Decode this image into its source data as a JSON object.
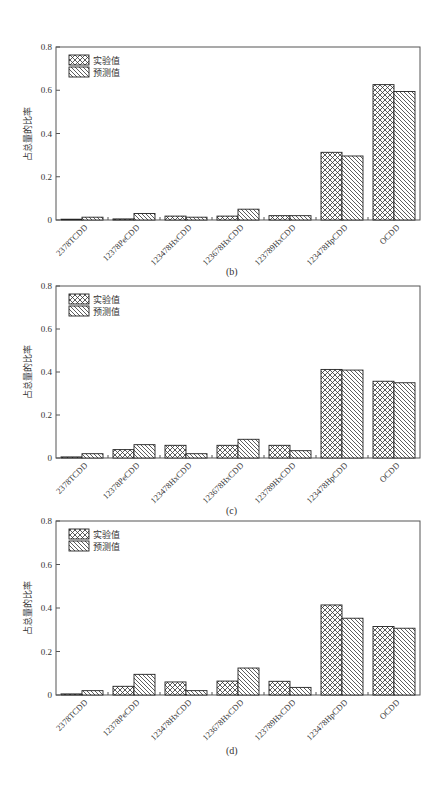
{
  "figure": {
    "panels": [
      {
        "id": "b",
        "caption": "(b)"
      },
      {
        "id": "c",
        "caption": "(c)"
      },
      {
        "id": "d",
        "caption": "(d)"
      }
    ]
  },
  "colors": {
    "axis": "#555555",
    "bar_stroke": "#222222",
    "pattern_line": "#333333",
    "background": "#ffffff"
  },
  "legend": {
    "experimental": "实验值",
    "predicted": "预测值"
  },
  "chart_data": [
    {
      "type": "bar",
      "title": "(b)",
      "xlabel": "",
      "ylabel": "占总量的比率",
      "ylim": [
        0,
        0.8
      ],
      "yticks": [
        "0",
        "0.2",
        "0.4",
        "0.6",
        "0.8"
      ],
      "grid": false,
      "legend_position": "upper left",
      "categories": [
        "2378TCDD",
        "12378PeCDD",
        "123478HxCDD",
        "123678HxCDD",
        "123789HxCDD",
        "123478HpCDD",
        "OCDD"
      ],
      "series": [
        {
          "name": "实验值",
          "pattern": "crosshatch",
          "values": [
            0.0,
            0.005,
            0.018,
            0.018,
            0.02,
            0.313,
            0.626
          ]
        },
        {
          "name": "预测值",
          "pattern": "diagonal",
          "values": [
            0.013,
            0.03,
            0.013,
            0.05,
            0.02,
            0.296,
            0.594
          ]
        }
      ]
    },
    {
      "type": "bar",
      "title": "(c)",
      "xlabel": "",
      "ylabel": "占总量的比率",
      "ylim": [
        0,
        0.8
      ],
      "yticks": [
        "0",
        "0.2",
        "0.4",
        "0.6",
        "0.8"
      ],
      "grid": false,
      "legend_position": "upper left",
      "categories": [
        "2378TCDD",
        "12378PeCDD",
        "123478HxCDD",
        "123678HxCDD",
        "123789HxCDD",
        "123478HpCDD",
        "OCDD"
      ],
      "series": [
        {
          "name": "实验值",
          "pattern": "crosshatch",
          "values": [
            0.005,
            0.039,
            0.059,
            0.059,
            0.059,
            0.412,
            0.357
          ]
        },
        {
          "name": "预测值",
          "pattern": "diagonal",
          "values": [
            0.02,
            0.062,
            0.02,
            0.087,
            0.034,
            0.409,
            0.35
          ]
        }
      ]
    },
    {
      "type": "bar",
      "title": "(d)",
      "xlabel": "",
      "ylabel": "占总量的比率",
      "ylim": [
        0,
        0.8
      ],
      "yticks": [
        "0",
        "0.2",
        "0.4",
        "0.6",
        "0.8"
      ],
      "grid": false,
      "legend_position": "upper left",
      "categories": [
        "2378TCDD",
        "12378PeCDD",
        "123478HxCDD",
        "123678HxCDD",
        "123789HxCDD",
        "123478HpCDD",
        "OCDD"
      ],
      "series": [
        {
          "name": "实验值",
          "pattern": "crosshatch",
          "values": [
            0.005,
            0.04,
            0.06,
            0.064,
            0.063,
            0.414,
            0.315
          ]
        },
        {
          "name": "预测值",
          "pattern": "diagonal",
          "values": [
            0.02,
            0.095,
            0.02,
            0.124,
            0.035,
            0.353,
            0.307
          ]
        }
      ]
    }
  ]
}
